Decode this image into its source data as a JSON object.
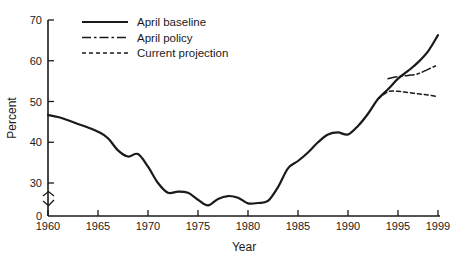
{
  "chart_data": {
    "type": "line",
    "title": "",
    "xlabel": "Year",
    "ylabel": "Percent",
    "xlim": [
      1960,
      1999
    ],
    "ylim": [
      0,
      70
    ],
    "y_axis_break": true,
    "y_axis_break_note": "axis broken between 0 and 30",
    "grid": false,
    "legend_position": "top-left-inside",
    "xticks": [
      1960,
      1965,
      1970,
      1975,
      1980,
      1985,
      1990,
      1995,
      1999
    ],
    "xtick_labels": [
      "1960",
      "1965",
      "1970",
      "1975",
      "1980",
      "1985",
      "1990",
      "1995",
      "1999"
    ],
    "yticks": [
      0,
      30,
      40,
      50,
      60,
      70
    ],
    "ytick_labels": [
      "0",
      "30",
      "40",
      "50",
      "60",
      "70"
    ],
    "series": [
      {
        "name": "April baseline",
        "style": "solid",
        "color": "#1a1a1a",
        "x": [
          1960,
          1961,
          1962,
          1963,
          1964,
          1965,
          1966,
          1967,
          1968,
          1969,
          1970,
          1971,
          1972,
          1973,
          1974,
          1975,
          1976,
          1977,
          1978,
          1979,
          1980,
          1981,
          1982,
          1983,
          1984,
          1985,
          1986,
          1987,
          1988,
          1989,
          1990,
          1991,
          1992,
          1993,
          1994,
          1995,
          1996,
          1997,
          1998,
          1999
        ],
        "values": [
          46.7,
          46.2,
          45.4,
          44.5,
          43.6,
          42.6,
          41.0,
          38.0,
          36.5,
          37.1,
          34.0,
          30.0,
          27.6,
          27.9,
          27.6,
          25.9,
          24.5,
          26.1,
          26.8,
          26.4,
          25.0,
          25.1,
          25.6,
          29.0,
          33.6,
          35.4,
          37.5,
          40.0,
          41.9,
          42.4,
          41.9,
          44.0,
          47.0,
          50.6,
          53.0,
          55.6,
          57.5,
          59.6,
          62.3,
          66.3
        ]
      },
      {
        "name": "April policy",
        "style": "dash-dot",
        "color": "#1a1a1a",
        "x": [
          1994,
          1995,
          1996,
          1997,
          1998,
          1999
        ],
        "values": [
          55.6,
          56.1,
          56.4,
          56.8,
          57.9,
          59.0
        ]
      },
      {
        "name": "Current projection",
        "style": "dashed",
        "color": "#1a1a1a",
        "x": [
          1993,
          1994,
          1995,
          1996,
          1997,
          1998,
          1999
        ],
        "values": [
          50.6,
          52.4,
          52.5,
          52.2,
          51.9,
          51.6,
          51.2
        ]
      }
    ]
  },
  "legend": {
    "items": [
      {
        "label": "April baseline",
        "style": "solid"
      },
      {
        "label": "April policy",
        "style": "dash-dot"
      },
      {
        "label": "Current projection",
        "style": "dashed"
      }
    ]
  },
  "axes": {
    "x_title": "Year",
    "y_title": "Percent"
  }
}
